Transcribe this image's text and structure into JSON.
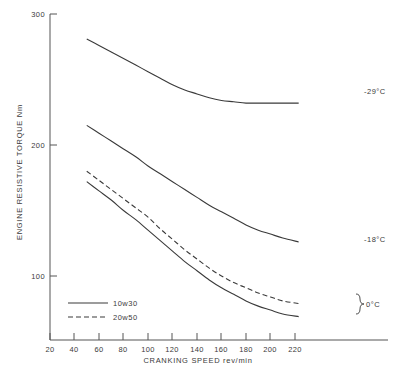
{
  "chart_data": {
    "type": "line",
    "title": "",
    "xlabel": "CRANKING SPEED   rev/min",
    "ylabel": "ENGINE RESISTIVE TORQUE   Nm",
    "xlim": [
      20,
      240
    ],
    "ylim": [
      0,
      300
    ],
    "xticks": [
      20,
      40,
      60,
      80,
      100,
      120,
      140,
      160,
      180,
      200,
      220
    ],
    "yticks": [
      100,
      200,
      300
    ],
    "xtick_labels": [
      "20",
      "40",
      "60",
      "80",
      "100",
      "120",
      "140",
      "160",
      "180",
      "200",
      "220"
    ],
    "ytick_labels": [
      "100",
      "200",
      "300"
    ],
    "grid": false,
    "legend_position": "lower-left",
    "legend": [
      {
        "label": "10w30",
        "style": "solid"
      },
      {
        "label": "20w50",
        "style": "dashed"
      }
    ],
    "series": [
      {
        "name": "-29°C",
        "oil": "10w30",
        "style": "solid",
        "annotation": "-29°C",
        "x": [
          50,
          60,
          70,
          80,
          90,
          100,
          110,
          120,
          130,
          140,
          150,
          160,
          170,
          180,
          190,
          200,
          210,
          223
        ],
        "y": [
          281,
          276,
          271,
          266,
          261,
          256,
          251,
          246,
          242,
          239,
          236,
          234,
          233,
          232,
          232,
          232,
          232,
          232
        ]
      },
      {
        "name": "-18°C",
        "oil": "10w30",
        "style": "solid",
        "annotation": "-18°C",
        "x": [
          50,
          60,
          70,
          80,
          90,
          100,
          110,
          120,
          130,
          140,
          150,
          160,
          170,
          180,
          190,
          200,
          210,
          223
        ],
        "y": [
          215,
          209,
          203,
          197,
          191,
          184,
          178,
          172,
          166,
          160,
          154,
          149,
          144,
          139,
          135,
          132,
          129,
          126
        ]
      },
      {
        "name": "0°C 20w50",
        "oil": "20w50",
        "style": "dashed",
        "annotation": "0°C",
        "x": [
          50,
          60,
          70,
          80,
          90,
          100,
          110,
          120,
          130,
          140,
          150,
          160,
          170,
          180,
          190,
          200,
          210,
          223
        ],
        "y": [
          180,
          173,
          166,
          159,
          152,
          145,
          136,
          128,
          120,
          113,
          106,
          100,
          95,
          91,
          87,
          84,
          81,
          79
        ]
      },
      {
        "name": "0°C 10w30",
        "oil": "10w30",
        "style": "solid",
        "annotation": "0°C",
        "x": [
          50,
          60,
          70,
          80,
          90,
          100,
          110,
          120,
          130,
          140,
          150,
          160,
          170,
          180,
          190,
          200,
          210,
          223
        ],
        "y": [
          172,
          165,
          158,
          150,
          143,
          135,
          127,
          119,
          111,
          104,
          97,
          91,
          86,
          81,
          77,
          74,
          71,
          69
        ]
      }
    ],
    "annotations": [
      {
        "text": "-29°C",
        "at_x": 228,
        "at_y": 232
      },
      {
        "text": "-18°C",
        "at_x": 228,
        "at_y": 126
      },
      {
        "text": "0°C",
        "at_x": 232,
        "at_y": 74
      }
    ]
  }
}
